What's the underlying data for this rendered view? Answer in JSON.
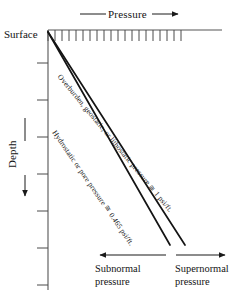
{
  "figure": {
    "background_color": "#ffffff",
    "line_color": "#1a1a1a"
  },
  "axes": {
    "top": {
      "label": "——— Pressure ——▶",
      "label_text": "Pressure",
      "direction": "right",
      "tick_count": 20,
      "tick_start_x": 48,
      "tick_end_x": 185,
      "axis_line_end_x": 222,
      "axis_y": 30
    },
    "left": {
      "label": "Depth",
      "direction": "down",
      "origin_label": "Surface",
      "tick_count": 7,
      "axis_x": 48,
      "axis_top_y": 30,
      "axis_bottom_y": 290
    }
  },
  "curves": [
    {
      "name": "overburden-pressure-line",
      "label": "Overburden, geostatic, or lithostatic pressure",
      "gradient_label": "≅ 1 psi/ft.",
      "x1": 48,
      "y1": 32,
      "x2": 185,
      "y2": 245,
      "stroke_width": 1.6
    },
    {
      "name": "hydrostatic-pressure-line",
      "label": "Hydrostatic or pore pressure",
      "gradient_label": "≅ 0.465 psi/ft.",
      "x1": 48,
      "y1": 32,
      "x2": 170,
      "y2": 245,
      "stroke_width": 1.6
    }
  ],
  "zones": {
    "subnormal": {
      "label": "Subnormal pressure",
      "arrow_direction": "left",
      "arrow_from_x": 166,
      "arrow_to_x": 99,
      "arrow_y": 255
    },
    "supernormal": {
      "label": "Supernormal pressure",
      "arrow_direction": "right",
      "arrow_from_x": 174,
      "arrow_to_x": 226,
      "arrow_y": 255
    }
  },
  "colors": {
    "ink": "#1a1a1a",
    "axis": "#4a4a4a",
    "paper": "#ffffff"
  }
}
